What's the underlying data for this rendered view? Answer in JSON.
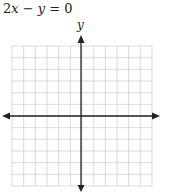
{
  "problem": {
    "equation": "2x − y = 0",
    "equation_parts": {
      "coef": "2",
      "var1": "x",
      "op": " − ",
      "var2": "y",
      "rhs": " = 0"
    }
  },
  "graph": {
    "y_axis_label": "y",
    "x_axis_label": "x",
    "grid": {
      "columns": 12,
      "rows": 12,
      "cell_px": 11.5
    },
    "origin_px": {
      "x": 81,
      "y": 116
    },
    "colors": {
      "grid": "#d0d0d0",
      "axis": "#222222",
      "text": "#222222"
    }
  }
}
